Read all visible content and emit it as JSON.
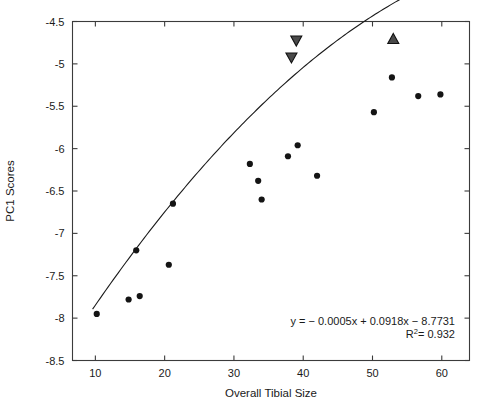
{
  "chart_data": {
    "type": "scatter",
    "title": "",
    "xlabel": "Overall Tibial Size",
    "ylabel": "PC1 Scores",
    "xlim": [
      6.7,
      64.0
    ],
    "ylim": [
      -8.5,
      -4.5
    ],
    "xticks": [
      10,
      20,
      30,
      40,
      50,
      60
    ],
    "xtick_labels": [
      "10",
      "20",
      "30",
      "40",
      "50",
      "60"
    ],
    "yticks": [
      -8.5,
      -8,
      -7.5,
      -7,
      -6.5,
      -6,
      -5.5,
      -5,
      -4.5
    ],
    "ytick_labels": [
      "-8.5",
      "-8",
      "-7.5",
      "-7",
      "-6.5",
      "-6",
      "-5.5",
      "-5",
      "-4.5"
    ],
    "grid": false,
    "legend": null,
    "frame": "box",
    "series": [
      {
        "name": "specimens",
        "marker": "filled-circle",
        "color": "#141414",
        "points": [
          {
            "x": 10.2,
            "y": -7.95
          },
          {
            "x": 14.8,
            "y": -7.78
          },
          {
            "x": 16.4,
            "y": -7.74
          },
          {
            "x": 15.9,
            "y": -7.2
          },
          {
            "x": 20.6,
            "y": -7.37
          },
          {
            "x": 21.2,
            "y": -6.65
          },
          {
            "x": 32.3,
            "y": -6.18
          },
          {
            "x": 33.5,
            "y": -6.38
          },
          {
            "x": 34.0,
            "y": -6.6
          },
          {
            "x": 37.8,
            "y": -6.09
          },
          {
            "x": 39.2,
            "y": -5.96
          },
          {
            "x": 42.0,
            "y": -6.32
          },
          {
            "x": 50.2,
            "y": -5.57
          },
          {
            "x": 52.8,
            "y": -5.16
          },
          {
            "x": 56.6,
            "y": -5.38
          },
          {
            "x": 59.8,
            "y": -5.36
          }
        ]
      },
      {
        "name": "down-triangle-outliers",
        "marker": "filled-down-triangle",
        "color": "#4a4a4a",
        "points": [
          {
            "x": 39.0,
            "y": -4.73
          },
          {
            "x": 38.3,
            "y": -4.93
          }
        ]
      },
      {
        "name": "up-triangle-outlier",
        "marker": "filled-up-triangle",
        "color": "#4a4a4a",
        "points": [
          {
            "x": 53.0,
            "y": -4.7
          }
        ]
      }
    ],
    "fit": {
      "type": "quadratic",
      "equation": "y = − 0.0005x + 0.0918x − 8.7731",
      "r_squared_label": "R",
      "r_squared_exponent": "2",
      "r_squared_value": "= 0.932",
      "coefficients": {
        "a": -0.0005,
        "b": 0.0918,
        "c": -8.7731
      },
      "r_squared": 0.932,
      "x_start": 9.6,
      "x_end": 61.5
    },
    "annotation_lines": [
      "y = − 0.0005x + 0.0918x − 8.7731",
      "R² = 0.932"
    ]
  },
  "axes": {
    "x_title": "Overall Tibial Size",
    "y_title": "PC1 Scores"
  },
  "colors": {
    "frame": "#3b3b3b",
    "point": "#141414",
    "triangle_fill": "#4a4a4a",
    "triangle_stroke": "#111111",
    "curve": "#1a1a1a",
    "text": "#1a1a1a",
    "background": "#ffffff"
  }
}
